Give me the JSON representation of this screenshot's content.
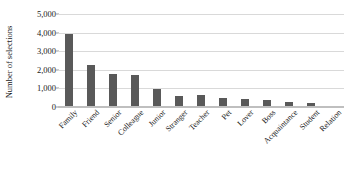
{
  "chart_data": {
    "type": "bar",
    "title": "",
    "xlabel": "",
    "ylabel": "Number of selections",
    "categories": [
      "Family",
      "Friend",
      "Senior",
      "Colleague",
      "Junior",
      "Stranger",
      "Teacher",
      "Pet",
      "Lover",
      "Boss",
      "Acquaintance",
      "Student",
      "Relation"
    ],
    "values": [
      3900,
      2250,
      1800,
      1700,
      950,
      600,
      620,
      480,
      430,
      400,
      250,
      230,
      70
    ],
    "ylim": [
      0,
      5000
    ],
    "ytick_labels": [
      "5,000",
      "4,000",
      "3,000",
      "2,000",
      "1,000",
      "0"
    ],
    "ytick_values": [
      5000,
      4000,
      3000,
      2000,
      1000,
      0
    ],
    "grid": true,
    "legend": "none",
    "bar_color": "#595959",
    "grid_color": "#d9d9d9",
    "text_color": "#1a1a1a"
  }
}
